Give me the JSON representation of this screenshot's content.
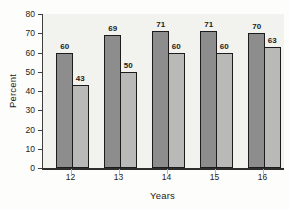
{
  "chart_data": {
    "type": "bar",
    "title": "",
    "xlabel": "Years",
    "ylabel": "Percent",
    "categories": [
      "12",
      "13",
      "14",
      "15",
      "16"
    ],
    "series": [
      {
        "name": "dark-gray-bars",
        "color": "#8d8d8d",
        "values": [
          60,
          69,
          71,
          71,
          70
        ]
      },
      {
        "name": "light-gray-bars",
        "color": "#b9bab8",
        "values": [
          43,
          50,
          60,
          60,
          63
        ]
      }
    ],
    "data_labels": [
      [
        "60",
        "69",
        "71",
        "71",
        "70"
      ],
      [
        "43",
        "50",
        "60",
        "60",
        "63"
      ]
    ],
    "ylim": [
      0,
      80
    ],
    "yticks": [
      "0",
      "10",
      "20",
      "30",
      "40",
      "50",
      "60",
      "70",
      "80"
    ],
    "grid": false,
    "legend": "none",
    "colors": {
      "bar_outline": "#1c1c1c",
      "plot_background": "#f2f2ef",
      "page_background": "#fdfdfb",
      "axis_line": "#3e3e3e",
      "baseline": "#2e2e2e",
      "category_tick": "#b3b3b0",
      "text": "#222222"
    }
  }
}
